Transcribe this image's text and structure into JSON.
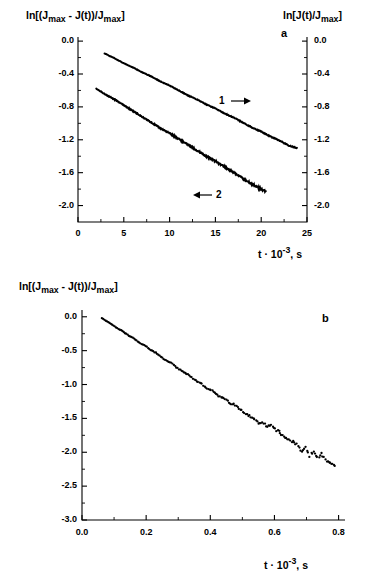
{
  "figure": {
    "background": "#ffffff",
    "ink": "#000000"
  },
  "panel_a": {
    "letter": "a",
    "left_axis_label_html": "ln[(J<sub>max</sub> - J(t))/J<sub>max</sub>]",
    "right_axis_label_html": "ln[J(t)/J<sub>max</sub>]",
    "x_axis_label_html": "t &middot; 10<sup>-3</sup>, s",
    "x_ticks": [
      "0",
      "5",
      "10",
      "15",
      "20",
      "25"
    ],
    "y_ticks_left": [
      "0.0",
      "-0.4",
      "-0.8",
      "-1.2",
      "-1.6",
      "-2.0"
    ],
    "y_ticks_right": [
      "0.0",
      "-0.4",
      "-0.8",
      "-1.2",
      "-1.6",
      "-2.0"
    ],
    "curve1_label": "1",
    "curve2_label": "2",
    "curve1_arrow": "arrow-right",
    "curve2_arrow": "arrow-left"
  },
  "panel_b": {
    "letter": "b",
    "y_axis_label_html": "ln[(J<sub>max</sub> - J(t))/J<sub>max</sub>]",
    "x_axis_label_html": "t &middot; 10<sup>-3</sup>, s",
    "x_ticks": [
      "0.0",
      "0.2",
      "0.4",
      "0.6",
      "0.8"
    ],
    "y_ticks": [
      "0.0",
      "-0.5",
      "-1.0",
      "-1.5",
      "-2.0",
      "-2.5",
      "-3.0"
    ]
  },
  "chart_data": [
    {
      "type": "line",
      "panel": "a",
      "title": "",
      "xlabel": "t x 10^-3, s",
      "ylabel_left": "ln[(Jmax - J(t))/Jmax]",
      "ylabel_right": "ln[J(t)/Jmax]",
      "xlim": [
        0,
        25
      ],
      "ylim_left": [
        -2.2,
        0.05
      ],
      "ylim_right": [
        -2.2,
        0.05
      ],
      "xticks": [
        0,
        5,
        10,
        15,
        20,
        25
      ],
      "yticks": [
        0.0,
        -0.4,
        -0.8,
        -1.2,
        -1.6,
        -2.0
      ],
      "grid": false,
      "legend": "inline-arrow-annotations",
      "series": [
        {
          "name": "1",
          "axis": "right",
          "annotation": "1 →",
          "x": [
            2.9,
            4.0,
            5.0,
            6.0,
            7.0,
            8.0,
            9.0,
            10.0,
            11.0,
            12.0,
            13.0,
            14.0,
            15.0,
            16.0,
            17.0,
            18.0,
            19.0,
            20.0,
            21.0,
            22.0,
            23.0,
            23.9
          ],
          "y": [
            -0.15,
            -0.21,
            -0.27,
            -0.32,
            -0.38,
            -0.43,
            -0.49,
            -0.54,
            -0.6,
            -0.66,
            -0.71,
            -0.77,
            -0.82,
            -0.88,
            -0.93,
            -0.99,
            -1.05,
            -1.1,
            -1.16,
            -1.21,
            -1.27,
            -1.3
          ]
        },
        {
          "name": "2",
          "axis": "left",
          "annotation": "← 2",
          "x": [
            2.0,
            3.0,
            4.0,
            5.0,
            6.0,
            7.0,
            8.0,
            9.0,
            10.0,
            11.0,
            12.0,
            13.0,
            14.0,
            15.0,
            16.0,
            17.0,
            18.0,
            19.0,
            20.0,
            20.5
          ],
          "y": [
            -0.58,
            -0.65,
            -0.71,
            -0.78,
            -0.85,
            -0.92,
            -0.99,
            -1.06,
            -1.12,
            -1.19,
            -1.26,
            -1.33,
            -1.4,
            -1.46,
            -1.53,
            -1.6,
            -1.67,
            -1.74,
            -1.8,
            -1.83
          ]
        }
      ]
    },
    {
      "type": "scatter",
      "panel": "b",
      "title": "",
      "xlabel": "t x 10^-3, s",
      "ylabel": "ln[(Jmax - J(t))/Jmax]",
      "xlim": [
        0.0,
        0.82
      ],
      "ylim": [
        -3.0,
        0.1
      ],
      "xticks": [
        0.0,
        0.2,
        0.4,
        0.6,
        0.8
      ],
      "yticks": [
        0.0,
        -0.5,
        -1.0,
        -1.5,
        -2.0,
        -2.5,
        -3.0
      ],
      "grid": false,
      "x": [
        0.062,
        0.074,
        0.086,
        0.098,
        0.11,
        0.122,
        0.134,
        0.146,
        0.158,
        0.17,
        0.182,
        0.194,
        0.206,
        0.218,
        0.23,
        0.242,
        0.254,
        0.266,
        0.278,
        0.29,
        0.302,
        0.314,
        0.326,
        0.338,
        0.35,
        0.362,
        0.374,
        0.386,
        0.398,
        0.41,
        0.422,
        0.434,
        0.446,
        0.458,
        0.47,
        0.482,
        0.494,
        0.506,
        0.518,
        0.53,
        0.542,
        0.554,
        0.566,
        0.578,
        0.59,
        0.602,
        0.614,
        0.626,
        0.638,
        0.65,
        0.662,
        0.674,
        0.686,
        0.698,
        0.71,
        0.722,
        0.734,
        0.746,
        0.758,
        0.77,
        0.782,
        0.792
      ],
      "y": [
        -0.02,
        -0.06,
        -0.09,
        -0.13,
        -0.17,
        -0.2,
        -0.24,
        -0.28,
        -0.31,
        -0.35,
        -0.39,
        -0.42,
        -0.46,
        -0.5,
        -0.53,
        -0.58,
        -0.62,
        -0.66,
        -0.68,
        -0.73,
        -0.77,
        -0.81,
        -0.84,
        -0.88,
        -0.93,
        -0.97,
        -0.99,
        -1.05,
        -1.08,
        -1.1,
        -1.16,
        -1.19,
        -1.22,
        -1.26,
        -1.29,
        -1.31,
        -1.37,
        -1.42,
        -1.45,
        -1.5,
        -1.53,
        -1.58,
        -1.57,
        -1.63,
        -1.6,
        -1.66,
        -1.7,
        -1.75,
        -1.79,
        -1.82,
        -1.86,
        -1.9,
        -2.0,
        -1.93,
        -2.05,
        -1.98,
        -2.09,
        -2.03,
        -2.12,
        -2.14,
        -2.19,
        -2.24
      ]
    }
  ]
}
